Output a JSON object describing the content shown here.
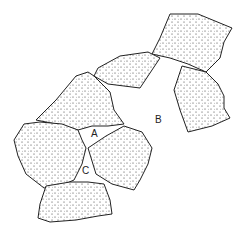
{
  "diagram": {
    "colors": {
      "outline": "#222222",
      "stipple": "#333333",
      "background": "#ffffff"
    },
    "labels": [
      {
        "id": "A",
        "text": "A",
        "x": 91,
        "y": 129
      },
      {
        "id": "B",
        "text": "B",
        "x": 155,
        "y": 115
      },
      {
        "id": "C",
        "text": "C",
        "x": 82,
        "y": 166
      }
    ],
    "stones": [
      {
        "name": "stone-top-right",
        "points": "170,14 198,14 232,28 224,42 220,58 206,72 188,64 170,58 152,54 160,38"
      },
      {
        "name": "stone-upper-middle",
        "points": "98,68 120,56 148,52 160,58 152,70 140,88 108,84 94,76"
      },
      {
        "name": "stone-right",
        "points": "182,66 206,72 218,84 224,96 224,108 230,118 212,126 188,132 180,110 174,90"
      },
      {
        "name": "stone-center-triangle",
        "points": "40,116 56,100 76,76 88,72 94,76 110,92 114,110 124,124 108,126 92,126 78,130 56,124 36,120"
      },
      {
        "name": "stone-left",
        "points": "24,124 40,122 62,124 78,130 82,140 86,148 82,164 74,180 60,186 44,188 26,174 18,156 14,140"
      },
      {
        "name": "stone-center-right",
        "points": "88,148 106,136 124,126 142,132 152,148 148,164 140,180 134,190 112,184 96,174"
      },
      {
        "name": "stone-bottom",
        "points": "46,186 70,182 88,182 104,184 110,200 112,214 98,216 76,220 50,222 38,218 40,204"
      }
    ]
  }
}
